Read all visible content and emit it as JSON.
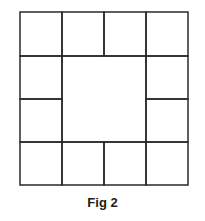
{
  "figure": {
    "caption": "Fig 2",
    "stroke_color": "#2a2a2a",
    "grid": {
      "origin": [
        20,
        12
      ],
      "columns": [
        20,
        62,
        104,
        146,
        188
      ],
      "rows": [
        12,
        56,
        99,
        142,
        185
      ],
      "cells": [
        {
          "col": 0,
          "row": 0,
          "colspan": 1,
          "rowspan": 1
        },
        {
          "col": 1,
          "row": 0,
          "colspan": 1,
          "rowspan": 1
        },
        {
          "col": 2,
          "row": 0,
          "colspan": 1,
          "rowspan": 1
        },
        {
          "col": 3,
          "row": 0,
          "colspan": 1,
          "rowspan": 1
        },
        {
          "col": 0,
          "row": 1,
          "colspan": 1,
          "rowspan": 1
        },
        {
          "col": 1,
          "row": 1,
          "colspan": 2,
          "rowspan": 2
        },
        {
          "col": 3,
          "row": 1,
          "colspan": 1,
          "rowspan": 1
        },
        {
          "col": 0,
          "row": 2,
          "colspan": 1,
          "rowspan": 1
        },
        {
          "col": 3,
          "row": 2,
          "colspan": 1,
          "rowspan": 1
        },
        {
          "col": 0,
          "row": 3,
          "colspan": 1,
          "rowspan": 1
        },
        {
          "col": 1,
          "row": 3,
          "colspan": 1,
          "rowspan": 1
        },
        {
          "col": 2,
          "row": 3,
          "colspan": 1,
          "rowspan": 1
        },
        {
          "col": 3,
          "row": 3,
          "colspan": 1,
          "rowspan": 1
        }
      ]
    }
  }
}
